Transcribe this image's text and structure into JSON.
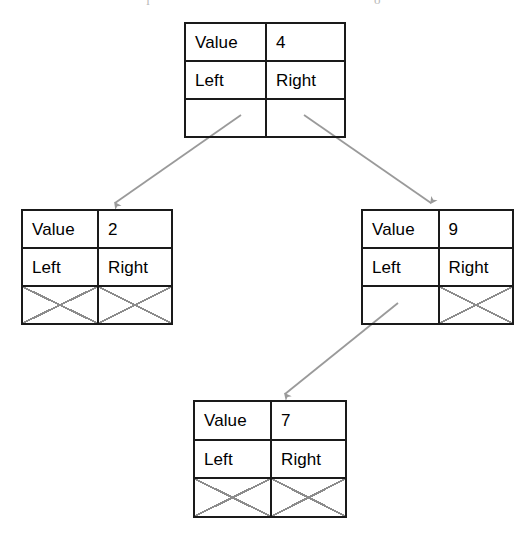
{
  "diagram": {
    "type": "binary-tree",
    "background_color": "#ffffff",
    "box_border_color": "#1a1a1a",
    "connector_color": "#9a9a9a",
    "null_mark_color": "#8c8c8c",
    "text_color": "#000000",
    "labels": {
      "value": "Value",
      "left": "Left",
      "right": "Right"
    },
    "nodes": [
      {
        "id": "root",
        "value": "4",
        "value_label": "Value",
        "left_label": "Left",
        "right_label": "Right",
        "left_is_null": false,
        "right_is_null": false,
        "x": 184,
        "y": 22,
        "width": 162,
        "height": 116
      },
      {
        "id": "left-child",
        "value": "2",
        "value_label": "Value",
        "left_label": "Left",
        "right_label": "Right",
        "left_is_null": true,
        "right_is_null": true,
        "x": 21,
        "y": 209,
        "width": 152,
        "height": 116
      },
      {
        "id": "right-child",
        "value": "9",
        "value_label": "Value",
        "left_label": "Left",
        "right_label": "Right",
        "left_is_null": false,
        "right_is_null": true,
        "x": 361,
        "y": 209,
        "width": 153,
        "height": 116
      },
      {
        "id": "grandchild",
        "value": "7",
        "value_label": "Value",
        "left_label": "Left",
        "right_label": "Right",
        "left_is_null": true,
        "right_is_null": true,
        "x": 193,
        "y": 400,
        "width": 154,
        "height": 118
      }
    ],
    "edges": [
      {
        "id": "root-to-left",
        "from": "root",
        "from_pointer": "Left",
        "to": "left-child",
        "x1": 241,
        "y1": 115,
        "x2": 115,
        "y2": 205
      },
      {
        "id": "root-to-right",
        "from": "root",
        "from_pointer": "Right",
        "to": "right-child",
        "x1": 304,
        "y1": 115,
        "x2": 431,
        "y2": 205
      },
      {
        "id": "right-to-grandchild",
        "from": "right-child",
        "from_pointer": "Left",
        "to": "grandchild",
        "x1": 398,
        "y1": 303,
        "x2": 285,
        "y2": 396
      }
    ],
    "scan_artifacts": [
      {
        "text": "ľ",
        "x": 146,
        "y": -6
      },
      {
        "text": "o",
        "x": 374,
        "y": -7
      }
    ]
  }
}
